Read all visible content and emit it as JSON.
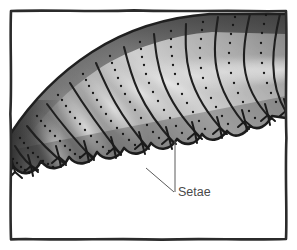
{
  "figure": {
    "domain": "diagram",
    "background_color": "#ffffff",
    "frame": {
      "name": "illustration-border",
      "style": "hand-drawn rectangle",
      "color": "#2b2b2b",
      "stroke_width": 2.6,
      "inset_px": 10
    },
    "annotations": [
      {
        "label": "Setae",
        "color": "#4a4a4a",
        "text_x": 178,
        "text_y": 196,
        "leaders": [
          {
            "from_x": 146,
            "from_y": 168,
            "to_x": 174,
            "to_y": 192
          },
          {
            "from_x": 175,
            "from_y": 141,
            "to_x": 175,
            "to_y": 192
          }
        ]
      }
    ],
    "body": {
      "name": "larva-body",
      "fill_light": "#e9e9e9",
      "fill_mid": "#a8a8a8",
      "fill_dark": "#4f4f4f",
      "outline_color": "#242424",
      "segment_count": 12,
      "scallop_count": 11,
      "dotted_line_color": "#1c1c1c",
      "dot_radius": 1.15,
      "setae_color": "#1a1a1a"
    }
  }
}
